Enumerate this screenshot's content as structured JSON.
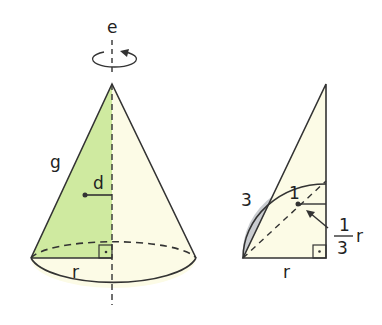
{
  "figure": {
    "colors": {
      "line": "#333333",
      "green_fill": "#cfeaa0",
      "cream_fill": "#fcfbe6",
      "gray_fill": "#c9ccd0"
    },
    "cone": {
      "axis_label": "e",
      "slant_label": "g",
      "distance_label": "d",
      "radius_label": "r"
    },
    "triangle": {
      "area_label_3": "3",
      "area_label_1": "1",
      "fraction_num": "1",
      "fraction_den": "3",
      "fraction_var": "r",
      "radius_label": "r"
    }
  }
}
